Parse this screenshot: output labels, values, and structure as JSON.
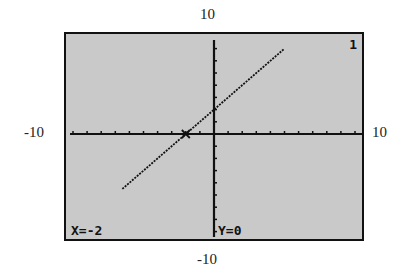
{
  "chart_data": {
    "type": "line",
    "title": "",
    "xlabel": "",
    "ylabel": "",
    "xlim": [
      -10,
      10
    ],
    "ylim": [
      -10,
      10
    ],
    "window_labels": {
      "top": "10",
      "bottom": "-10",
      "left": "-10",
      "right": "10"
    },
    "series": [
      {
        "name": "Y1",
        "equation": "y = x + 2",
        "x": [
          -6.5,
          -2,
          0,
          5
        ],
        "y": [
          -4.5,
          0,
          2,
          7
        ]
      }
    ],
    "trace": {
      "x": -2,
      "y": 0
    },
    "grid": false,
    "tick_spacing": 1
  },
  "screen": {
    "readout_x": "X=-2",
    "readout_y": "Y=0",
    "plot_number": "1"
  },
  "colors": {
    "screen_bg": "#c9c9c9",
    "ink": "#111111"
  }
}
